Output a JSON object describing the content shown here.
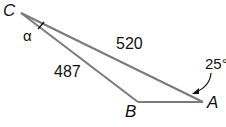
{
  "diagram": {
    "type": "triangle",
    "vertices": {
      "C": {
        "label": "C",
        "x": 21,
        "y": 13
      },
      "B": {
        "label": "B",
        "x": 138,
        "y": 102
      },
      "A": {
        "label": "A",
        "x": 203,
        "y": 102
      }
    },
    "sides": {
      "CA": {
        "label": "520"
      },
      "CB": {
        "label": "487"
      }
    },
    "angles": {
      "C": {
        "label": "α"
      },
      "A": {
        "label": "25°"
      }
    },
    "colors": {
      "line": "#777777",
      "text": "#111111"
    }
  }
}
